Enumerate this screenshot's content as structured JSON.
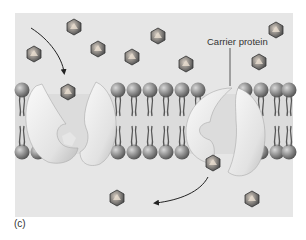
{
  "figure": {
    "panel_label": "(c)",
    "callout_label": "Carrier protein",
    "colors": {
      "background": "#e6e6e6",
      "page": "#ffffff",
      "lipid_head": "#8a8a8a",
      "lipid_tail": "#555555",
      "protein": "#f0f0f0",
      "solute": "#6b6b6b",
      "arrow": "#222222"
    },
    "molecules": [
      {
        "x": 74,
        "y": 27
      },
      {
        "x": 34,
        "y": 54
      },
      {
        "x": 98,
        "y": 49
      },
      {
        "x": 132,
        "y": 57
      },
      {
        "x": 158,
        "y": 36
      },
      {
        "x": 187,
        "y": 64
      },
      {
        "x": 258,
        "y": 30
      },
      {
        "x": 259,
        "y": 62
      },
      {
        "x": 68,
        "y": 92
      },
      {
        "x": 213,
        "y": 163
      },
      {
        "x": 250,
        "y": 199
      },
      {
        "x": 251,
        "y": 199
      }
    ],
    "proteins": [
      {
        "name": "carrier-protein-open-outside",
        "cx": 68,
        "cy": 124
      },
      {
        "name": "carrier-protein-open-inside",
        "cx": 230,
        "cy": 124
      }
    ]
  }
}
